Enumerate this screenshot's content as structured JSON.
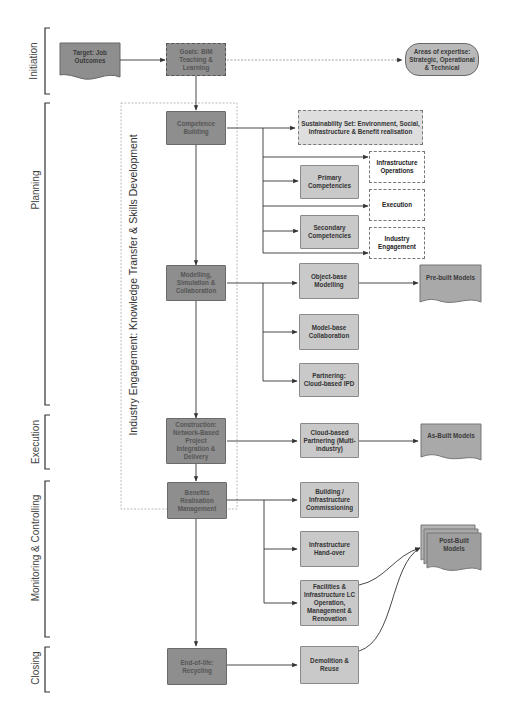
{
  "phases": [
    {
      "label": "Initiation",
      "top": 28,
      "bottom": 94
    },
    {
      "label": "Planning",
      "top": 103,
      "bottom": 405
    },
    {
      "label": "Execution",
      "top": 415,
      "bottom": 469
    },
    {
      "label": "Monitoring & Controlling",
      "top": 481,
      "bottom": 637
    },
    {
      "label": "Closing",
      "top": 647,
      "bottom": 692
    }
  ],
  "region": {
    "label": "Industry Engagement: Knowledge Transfer & Skills Development"
  },
  "nodes": {
    "target": {
      "label": "Target: Job Outcomes"
    },
    "goals": {
      "label": "Goals: BIM Teaching & Learning"
    },
    "areas": {
      "label": "Areas of expertise: Strategic, Operational & Technical"
    },
    "competence": {
      "label": "Competence Building"
    },
    "sustainability": {
      "label": "Sustainability Set: Environment, Social, Infrastructure & Benefit realisation"
    },
    "primary": {
      "label": "Primary Competencies"
    },
    "secondary": {
      "label": "Secondary Competencies"
    },
    "infra_ops": {
      "label": "Infrastructure Operations"
    },
    "execution": {
      "label": "Execution"
    },
    "industry_eng": {
      "label": "Industry Engagement"
    },
    "modelling": {
      "label": "Modelling, Simulation & Collaboration"
    },
    "object_base": {
      "label": "Object-base Modelling"
    },
    "prebuilt": {
      "label": "Pre-built Models"
    },
    "model_base": {
      "label": "Model-base Collaboration"
    },
    "partnering": {
      "label": "Partnering: Cloud-based IPD"
    },
    "construction": {
      "label": "Construction: Network-Based Project Integration & Delivery"
    },
    "cloud_partnering": {
      "label": "Cloud-based Partnering (Multi-industry)"
    },
    "asbuilt": {
      "label": "As-Built Models"
    },
    "benefits": {
      "label": "Benefits Realisation Management"
    },
    "commissioning": {
      "label": "Building / Infrastructure Commissioning"
    },
    "handover": {
      "label": "Infrastructure Hand-over"
    },
    "facilities": {
      "label": "Facilities & Infrastructure LC Operation, Management & Renovation"
    },
    "postbuilt": {
      "label": "Post-Built Models"
    },
    "endoflife": {
      "label": "End-of-life: Recycling"
    },
    "demolition": {
      "label": "Demolition & Reuse"
    }
  },
  "colors": {
    "dark_node": "#8e8e8e",
    "light_node": "#c9c9c9",
    "line": "#444444",
    "dotted_region": "#aaaaaa"
  }
}
